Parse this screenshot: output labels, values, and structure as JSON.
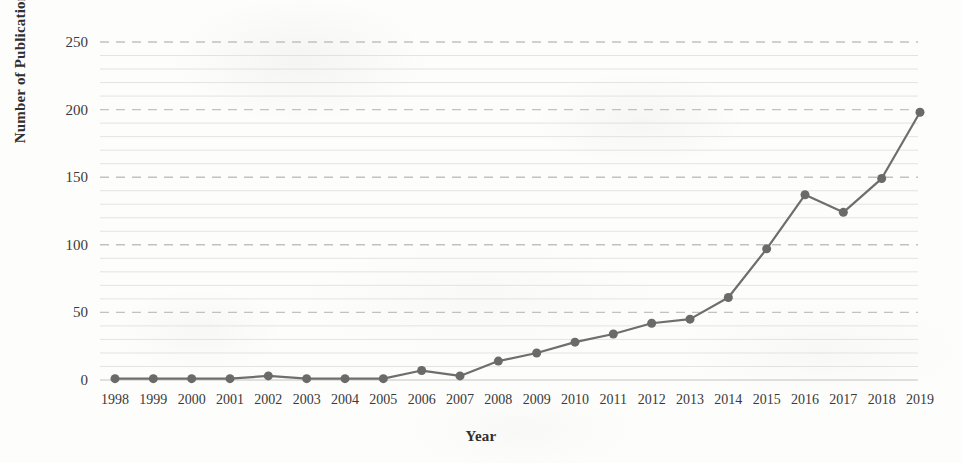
{
  "chart_data": {
    "type": "line",
    "title": "",
    "xlabel": "Year",
    "ylabel": "Number of Publications",
    "categories": [
      "1998",
      "1999",
      "2000",
      "2001",
      "2002",
      "2003",
      "2004",
      "2005",
      "2006",
      "2007",
      "2008",
      "2009",
      "2010",
      "2011",
      "2012",
      "2013",
      "2014",
      "2015",
      "2016",
      "2017",
      "2018",
      "2019"
    ],
    "values": [
      1,
      1,
      1,
      1,
      3,
      1,
      1,
      1,
      7,
      3,
      14,
      20,
      28,
      34,
      42,
      45,
      61,
      97,
      137,
      124,
      149,
      198
    ],
    "series": [
      {
        "name": "Number of Publications",
        "values": [
          1,
          1,
          1,
          1,
          3,
          1,
          1,
          1,
          7,
          3,
          14,
          20,
          28,
          34,
          42,
          45,
          61,
          97,
          137,
          124,
          149,
          198
        ]
      }
    ],
    "ylim": [
      0,
      250
    ],
    "y_ticks": [
      0,
      50,
      100,
      150,
      200,
      250
    ],
    "y_tick_labels": [
      "0",
      "50",
      "100",
      "150",
      "200",
      "250"
    ],
    "x_tick_labels": [
      "1998",
      "1999",
      "2000",
      "2001",
      "2002",
      "2003",
      "2004",
      "2005",
      "2006",
      "2007",
      "2008",
      "2009",
      "2010",
      "2011",
      "2012",
      "2013",
      "2014",
      "2015",
      "2016",
      "2017",
      "2018",
      "2019"
    ],
    "grid": {
      "major_on": true,
      "minor_on": true,
      "major_interval": 50,
      "minor_interval": 10,
      "style": "dashed",
      "axis": "y"
    },
    "legend": {
      "visible": false,
      "position": "none",
      "entries": []
    },
    "marker": {
      "shape": "circle",
      "size": 9
    },
    "colors": {
      "line": "#6e6e6e",
      "marker": "#6a6a6a",
      "major_gridline": "#b8b8b8",
      "minor_gridline": "#dcdcdc",
      "text": "#333333",
      "background": "#fdfdfc"
    },
    "annotations": []
  }
}
